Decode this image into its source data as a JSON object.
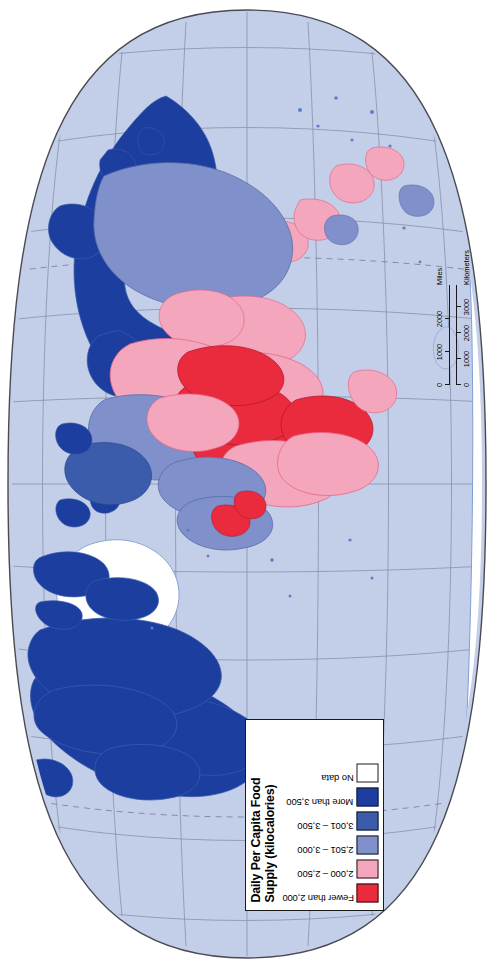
{
  "map": {
    "projection": "oval-robinson",
    "orientation": "rotated-90-clockwise",
    "ocean_color": "#c3cfe9",
    "graticule_color": "#8a93ab",
    "outline_color": "#4a4a52",
    "background_color": "#ffffff"
  },
  "legend": {
    "title": "Daily Per Capita Food Supply (kilocalories)",
    "title_line_1": "Daily Per Capita Food",
    "title_line_2": "Supply (kilocalories)",
    "items": [
      {
        "label": "Fewer than 2,000",
        "color": "#ea2b3e"
      },
      {
        "label": "2,000 – 2,500",
        "color": "#f4a6bc"
      },
      {
        "label": "2,501 – 3,000",
        "color": "#7f90cb"
      },
      {
        "label": "3,001 – 3,500",
        "color": "#3a5cab"
      },
      {
        "label": "More than 3,500",
        "color": "#1c3f9f"
      },
      {
        "label": "No data",
        "color": "#ffffff"
      }
    ]
  },
  "scalebar": {
    "miles": {
      "unit": "Miles",
      "ticks": [
        "0",
        "1000",
        "2000"
      ]
    },
    "kilometers": {
      "unit": "Kilometers",
      "ticks": [
        "0",
        "1000",
        "2000",
        "3000"
      ]
    }
  },
  "chart_data": {
    "type": "map",
    "title": "Daily Per Capita Food Supply (kilocalories)",
    "classes": [
      {
        "label": "Fewer than 2,000",
        "color": "#ea2b3e"
      },
      {
        "label": "2,000 – 2,500",
        "color": "#f4a6bc"
      },
      {
        "label": "2,501 – 3,000",
        "color": "#7f90cb"
      },
      {
        "label": "3,001 – 3,500",
        "color": "#3a5cab"
      },
      {
        "label": "More than 3,500",
        "color": "#1c3f9f"
      },
      {
        "label": "No data",
        "color": "#ffffff"
      }
    ],
    "regions": [
      {
        "name": "North America",
        "class": "More than 3,500"
      },
      {
        "name": "Greenland",
        "class": "No data"
      },
      {
        "name": "South America",
        "class": "2,501 – 3,000"
      },
      {
        "name": "Western Europe",
        "class": "More than 3,500"
      },
      {
        "name": "Eastern Europe",
        "class": "3,001 – 3,500"
      },
      {
        "name": "Russia",
        "class": "3,001 – 3,500"
      },
      {
        "name": "Sub-Saharan Africa",
        "class": "Fewer than 2,000"
      },
      {
        "name": "North Africa",
        "class": "3,001 – 3,500"
      },
      {
        "name": "South Asia",
        "class": "2,000 – 2,500"
      },
      {
        "name": "East Asia",
        "class": "2,501 – 3,000"
      },
      {
        "name": "Australia",
        "class": "More than 3,500"
      },
      {
        "name": "Antarctica",
        "class": "No data"
      }
    ]
  }
}
